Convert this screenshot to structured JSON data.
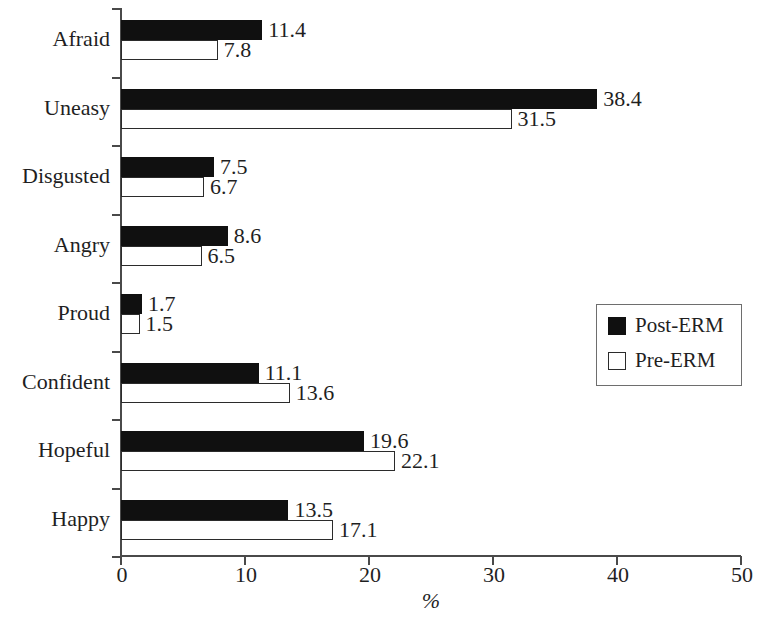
{
  "chart_data": {
    "type": "bar",
    "orientation": "horizontal",
    "title": "",
    "xlabel": "%",
    "ylabel": "",
    "xlim": [
      0,
      50
    ],
    "xticks": [
      0,
      10,
      20,
      30,
      40,
      50
    ],
    "xtick_labels": [
      "0",
      "10",
      "20",
      "30",
      "40",
      "50"
    ],
    "grid": false,
    "legend_position": "center-right",
    "categories": [
      "Afraid",
      "Uneasy",
      "Disgusted",
      "Angry",
      "Proud",
      "Confident",
      "Hopeful",
      "Happy"
    ],
    "series": [
      {
        "name": "Post-ERM",
        "color": "#101010",
        "style": "filled",
        "values": [
          11.4,
          38.4,
          7.5,
          8.6,
          1.7,
          11.1,
          19.6,
          13.5
        ],
        "labels": [
          "11.4",
          "38.4",
          "7.5",
          "8.6",
          "1.7",
          "11.1",
          "19.6",
          "13.5"
        ]
      },
      {
        "name": "Pre-ERM",
        "color": "#ffffff",
        "style": "outline",
        "values": [
          7.8,
          31.5,
          6.7,
          6.5,
          1.5,
          13.6,
          22.1,
          17.1
        ],
        "labels": [
          "7.8",
          "31.5",
          "6.7",
          "6.5",
          "1.5",
          "13.6",
          "22.1",
          "17.1"
        ]
      }
    ]
  },
  "legend": {
    "entries": [
      {
        "label": "Post-ERM",
        "swatch": "filled-black-square"
      },
      {
        "label": "Pre-ERM",
        "swatch": "outline-white-square"
      }
    ]
  },
  "colors": {
    "bar_fill": "#101010",
    "bar_outline": "#2b2b2b",
    "axis": "#4a4a4a",
    "text": "#1f1f1f",
    "background": "#ffffff"
  }
}
